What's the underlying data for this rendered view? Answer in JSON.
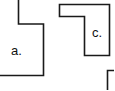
{
  "diagram": {
    "stroke_color": "#1a1a1a",
    "background": "#ffffff",
    "shapes": [
      {
        "id": "a",
        "label": "a.",
        "points": "-2,-2 18.5,-2 18.5,24 43.5,24 43.5,75.5 -2,75.5",
        "label_x": 11,
        "label_y": 55
      },
      {
        "id": "c",
        "label": "c.",
        "points": "59.5,4.5 109.5,4.5 109.5,55.5 84.5,55.5 84.5,16.5 59.5,16.5",
        "label_x": 92,
        "label_y": 37
      },
      {
        "id": "partial",
        "label": "",
        "points": "116,70.5 107.5,70.5 107.5,92",
        "label_x": 0,
        "label_y": 0
      }
    ]
  }
}
